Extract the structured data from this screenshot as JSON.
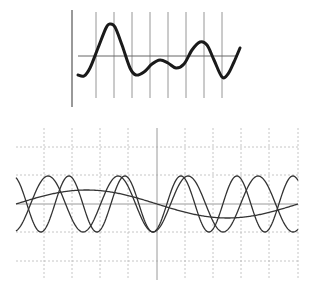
{
  "top_figure": {
    "description": "Composite waveform on a vertical-line grid",
    "axis": {
      "x": 72,
      "y1": 10,
      "y2": 107
    },
    "baseline": {
      "y": 56,
      "x1": 78,
      "x2": 238
    },
    "vlines_x": [
      96,
      114,
      132,
      150,
      168,
      186,
      204,
      222
    ],
    "vline_y": [
      12,
      98
    ],
    "curve_points": [
      [
        78,
        75
      ],
      [
        84,
        76
      ],
      [
        90,
        68
      ],
      [
        98,
        48
      ],
      [
        106,
        28
      ],
      [
        110,
        24
      ],
      [
        115,
        27
      ],
      [
        122,
        45
      ],
      [
        130,
        68
      ],
      [
        136,
        75
      ],
      [
        144,
        72
      ],
      [
        152,
        64
      ],
      [
        160,
        60
      ],
      [
        168,
        63
      ],
      [
        176,
        68
      ],
      [
        184,
        64
      ],
      [
        192,
        50
      ],
      [
        200,
        42
      ],
      [
        207,
        45
      ],
      [
        214,
        60
      ],
      [
        222,
        77
      ],
      [
        228,
        74
      ],
      [
        234,
        62
      ],
      [
        240,
        48
      ]
    ],
    "colors": {
      "curve": "#1a1a1a",
      "grid": "#8a8a8a"
    }
  },
  "bottom_figure": {
    "description": "Three superimposed sine waves of different frequencies on a dashed grid",
    "plot": {
      "x1": 16,
      "x2": 298,
      "y1": 128,
      "y2": 280
    },
    "vlines_x": [
      44,
      72,
      100,
      128,
      157,
      185,
      213,
      241,
      269,
      298
    ],
    "solid_vline_x": 157,
    "hlines_y": [
      147,
      175,
      204,
      232,
      261
    ],
    "solid_hline_y": 204,
    "series": [
      {
        "name": "slow wave",
        "amplitude": 14,
        "period": 282,
        "phase": 0,
        "center": 204
      },
      {
        "name": "medium wave A",
        "amplitude": 28,
        "period": 56,
        "phase": 0.35,
        "center": 204
      },
      {
        "name": "medium wave B",
        "amplitude": 28,
        "period": 70,
        "phase": 3.4,
        "center": 204
      }
    ],
    "colors": {
      "curve": "#333333",
      "grid": "#b8b8b8",
      "axis": "#9a9a9a"
    }
  }
}
